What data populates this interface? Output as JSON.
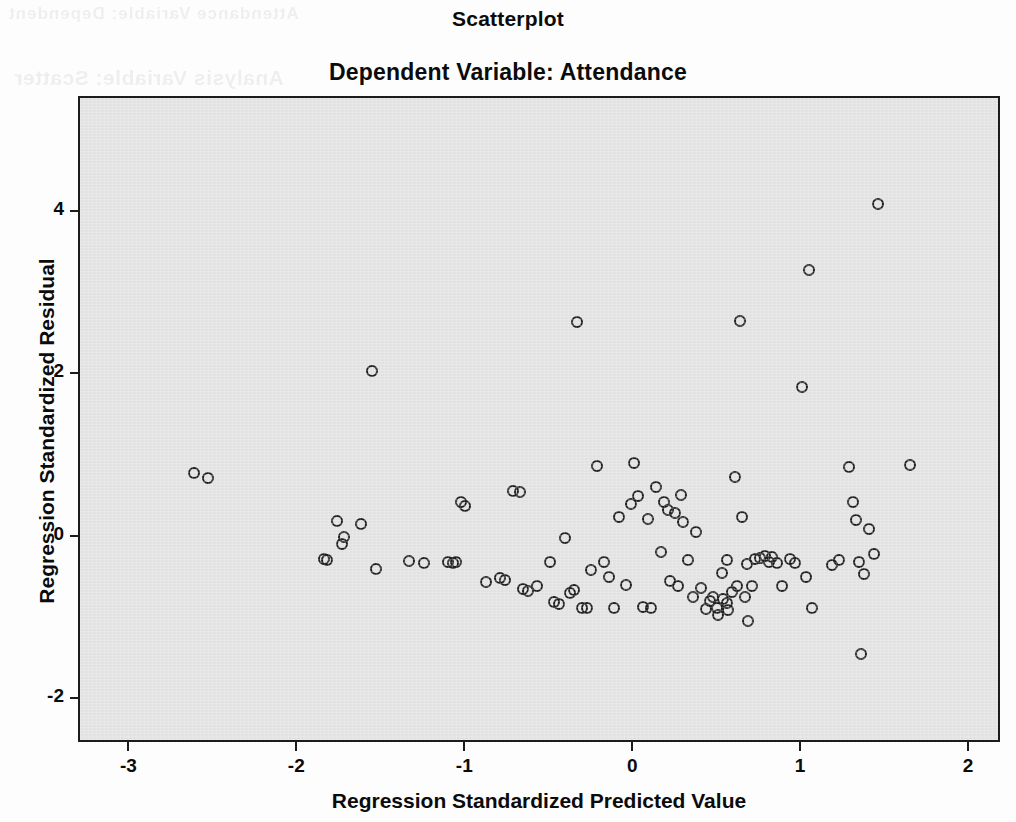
{
  "figure": {
    "title": "Scatterplot",
    "subtitle": "Dependent Variable: Attendance",
    "background_color": "#fdfdfd",
    "panel_color": "#e2e2e2",
    "marker_color": "#202020",
    "axis_color": "#1c1c1c"
  },
  "ghost_text": {
    "line1": "Attendance Variable: Dependent",
    "line2": "Analysis Variable: Scatter"
  },
  "chart_data": {
    "type": "scatter",
    "title": "Scatterplot",
    "subtitle": "Dependent Variable: Attendance",
    "xlabel": "Regression Standardized Predicted Value",
    "ylabel": "Regression Standardized Residual",
    "xlim": [
      -3.3,
      2.19
    ],
    "ylim": [
      -2.54,
      5.41
    ],
    "xticks": [
      -3,
      -2,
      -1,
      0,
      1,
      2
    ],
    "xtick_labels": [
      "-3",
      "-2",
      "-1",
      "0",
      "1",
      "2"
    ],
    "yticks": [
      4,
      2,
      0,
      -2
    ],
    "ytick_labels": [
      "4",
      "2",
      "0",
      "-2"
    ],
    "grid": false,
    "legend": null,
    "marker": "open-circle",
    "marker_size_px": 12,
    "n_points": 104,
    "points": [
      [
        -2.62,
        0.79
      ],
      [
        -2.54,
        0.73
      ],
      [
        -1.85,
        -0.26
      ],
      [
        -1.83,
        -0.28
      ],
      [
        -1.77,
        0.2
      ],
      [
        -1.74,
        -0.08
      ],
      [
        -1.73,
        0.01
      ],
      [
        -1.63,
        0.17
      ],
      [
        -1.56,
        2.05
      ],
      [
        -1.54,
        -0.39
      ],
      [
        -1.34,
        -0.29
      ],
      [
        -1.25,
        -0.31
      ],
      [
        -1.11,
        -0.3
      ],
      [
        -1.08,
        -0.31
      ],
      [
        -1.06,
        -0.3
      ],
      [
        -1.03,
        0.44
      ],
      [
        -1.01,
        0.39
      ],
      [
        -0.88,
        -0.54
      ],
      [
        -0.8,
        -0.5
      ],
      [
        -0.77,
        -0.52
      ],
      [
        -0.72,
        0.57
      ],
      [
        -0.68,
        0.56
      ],
      [
        -0.66,
        -0.63
      ],
      [
        -0.63,
        -0.66
      ],
      [
        -0.58,
        -0.59
      ],
      [
        -0.48,
        -0.79
      ],
      [
        -0.45,
        -0.82
      ],
      [
        -0.41,
        0.0
      ],
      [
        -0.38,
        -0.68
      ],
      [
        -0.36,
        -0.65
      ],
      [
        -0.34,
        2.66
      ],
      [
        -0.31,
        -0.87
      ],
      [
        -0.28,
        -0.86
      ],
      [
        -0.26,
        -0.4
      ],
      [
        -0.22,
        0.88
      ],
      [
        -0.18,
        -0.3
      ],
      [
        -0.15,
        -0.48
      ],
      [
        -0.12,
        -0.86
      ],
      [
        -0.09,
        0.26
      ],
      [
        -0.05,
        -0.58
      ],
      [
        -0.02,
        0.42
      ],
      [
        0.0,
        0.92
      ],
      [
        0.02,
        0.51
      ],
      [
        0.05,
        -0.85
      ],
      [
        0.08,
        0.23
      ],
      [
        0.1,
        -0.86
      ],
      [
        0.13,
        0.62
      ],
      [
        0.16,
        -0.18
      ],
      [
        0.18,
        0.44
      ],
      [
        0.21,
        -0.53
      ],
      [
        0.24,
        0.3
      ],
      [
        0.26,
        -0.59
      ],
      [
        0.29,
        0.19
      ],
      [
        0.32,
        -0.28
      ],
      [
        0.35,
        -0.73
      ],
      [
        0.37,
        0.07
      ],
      [
        0.4,
        -0.62
      ],
      [
        0.43,
        -0.88
      ],
      [
        0.45,
        -0.78
      ],
      [
        0.47,
        -0.73
      ],
      [
        0.49,
        -0.86
      ],
      [
        0.5,
        -0.95
      ],
      [
        0.52,
        -0.44
      ],
      [
        0.53,
        -0.76
      ],
      [
        0.55,
        -0.81
      ],
      [
        0.56,
        -0.89
      ],
      [
        0.58,
        -0.67
      ],
      [
        0.6,
        0.75
      ],
      [
        0.61,
        -0.59
      ],
      [
        0.63,
        2.67
      ],
      [
        0.64,
        0.25
      ],
      [
        0.66,
        -0.73
      ],
      [
        0.68,
        -1.02
      ],
      [
        0.7,
        -0.6
      ],
      [
        0.72,
        -0.26
      ],
      [
        0.75,
        -0.25
      ],
      [
        0.78,
        -0.22
      ],
      [
        0.8,
        -0.3
      ],
      [
        0.82,
        -0.24
      ],
      [
        0.85,
        -0.31
      ],
      [
        0.88,
        -0.59
      ],
      [
        0.93,
        -0.26
      ],
      [
        0.96,
        -0.31
      ],
      [
        1.0,
        1.85
      ],
      [
        1.02,
        -0.49
      ],
      [
        1.04,
        3.3
      ],
      [
        1.06,
        -0.86
      ],
      [
        1.18,
        -0.34
      ],
      [
        1.22,
        -0.27
      ],
      [
        1.28,
        0.87
      ],
      [
        1.3,
        0.44
      ],
      [
        1.32,
        0.22
      ],
      [
        1.34,
        -0.3
      ],
      [
        1.35,
        -1.43
      ],
      [
        1.37,
        -0.45
      ],
      [
        1.4,
        0.11
      ],
      [
        1.43,
        -0.2
      ],
      [
        1.45,
        4.1
      ],
      [
        1.64,
        0.9
      ],
      [
        0.2,
        0.34
      ],
      [
        0.55,
        -0.28
      ],
      [
        0.67,
        -0.33
      ],
      [
        -0.5,
        -0.3
      ],
      [
        0.28,
        0.52
      ]
    ]
  }
}
